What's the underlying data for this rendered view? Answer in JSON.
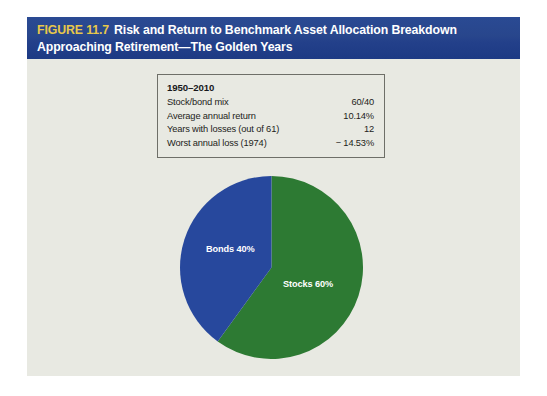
{
  "figure": {
    "number_label": "FIGURE 11.7",
    "title_line1": "Risk and Return to Benchmark Asset Allocation Breakdown",
    "title_line2": "Approaching Retirement—The Golden Years",
    "banner_color": "#264a92",
    "number_color": "#e8c84a",
    "panel_color": "#e8e9e2"
  },
  "data_table": {
    "period_label": "1950–2010",
    "rows": [
      {
        "label": "Stock/bond mix",
        "value": "60/40"
      },
      {
        "label": "Average annual return",
        "value": "10.14%"
      },
      {
        "label": "Years with losses (out of 61)",
        "value": "12"
      },
      {
        "label": "Worst annual loss (1974)",
        "value": "− 14.53%"
      }
    ]
  },
  "chart_data": {
    "type": "pie",
    "title": "",
    "categories": [
      "Stocks",
      "Bonds"
    ],
    "values": [
      60,
      40
    ],
    "labels": [
      "Stocks 60%",
      "Bonds 40%"
    ],
    "colors": [
      "#2d7a33",
      "#27489d"
    ],
    "start_angle_deg": 0,
    "direction": "clockwise",
    "legend": "none",
    "grid": false,
    "annotations": [
      {
        "text": "Stocks 60%",
        "slice": "Stocks",
        "color": "#ffffff"
      },
      {
        "text": "Bonds 40%",
        "slice": "Bonds",
        "color": "#ffffff"
      }
    ]
  }
}
